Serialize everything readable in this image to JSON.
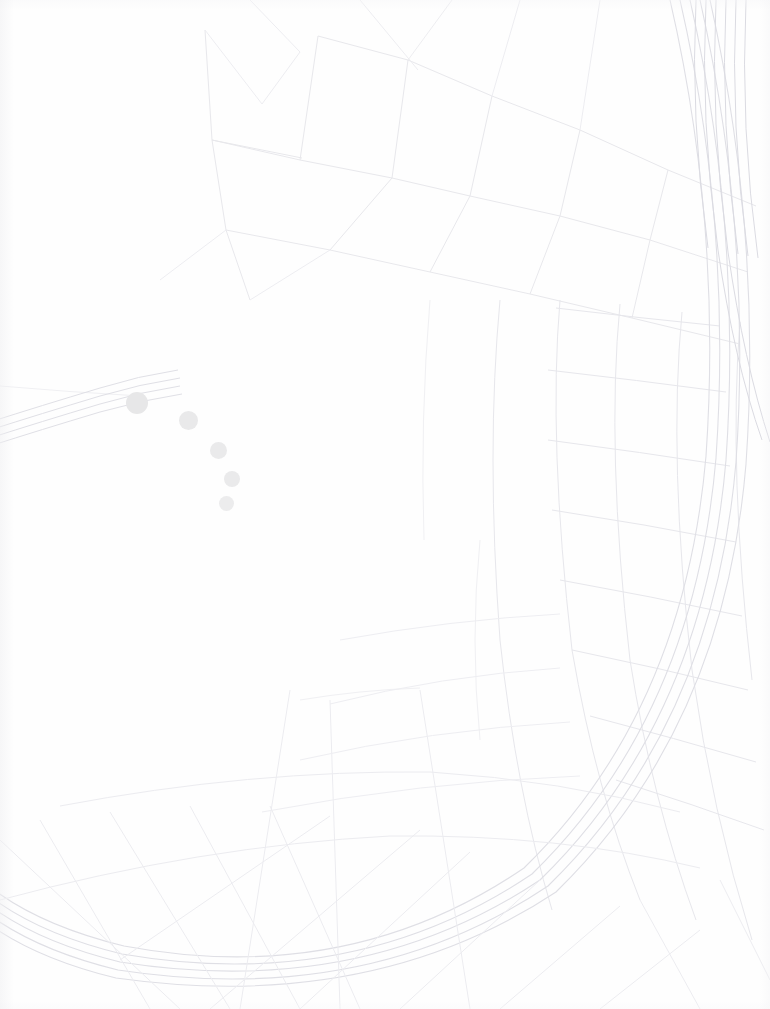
{
  "app": {
    "name": "map-viewer",
    "state": "loading",
    "canvas_width": 770,
    "canvas_height": 1009,
    "background_color": "#fefefe"
  },
  "loading": {
    "status_text": "",
    "spinner_name": "arc-dot-spinner",
    "dot_count": 5,
    "dot_color": "#e9e9ea",
    "dots": [
      {
        "label": "dot-1",
        "cx": 137,
        "cy": 403,
        "r": 11,
        "color": "#e7e7e8"
      },
      {
        "label": "dot-2",
        "cx": 188,
        "cy": 420,
        "r": 9.5,
        "color": "#e9e9ea"
      },
      {
        "label": "dot-3",
        "cx": 218,
        "cy": 450,
        "r": 8.5,
        "color": "#eaeaeb"
      },
      {
        "label": "dot-4",
        "cx": 232,
        "cy": 479,
        "r": 8,
        "color": "#eaeaeb"
      },
      {
        "label": "dot-5",
        "cx": 226,
        "cy": 503,
        "r": 7.5,
        "color": "#ececed"
      }
    ]
  },
  "map": {
    "render_opacity": "very-low",
    "line_color": "#e4e4e8",
    "highway_color": "#dcdce2",
    "features": [
      {
        "name": "ring-road",
        "type": "arc",
        "description": "large circular motorway sweeping through lower half"
      },
      {
        "name": "radial-freeway",
        "type": "bundle",
        "description": "bundle of parallel carriageways at upper right"
      },
      {
        "name": "street-grid-north",
        "type": "grid",
        "description": "block outlines upper centre"
      },
      {
        "name": "street-grid-east",
        "type": "grid",
        "description": "curved block grid right side"
      },
      {
        "name": "highway-west",
        "type": "band",
        "description": "road band entering left edge near y=400"
      },
      {
        "name": "radial-spokes-south",
        "type": "lines",
        "description": "radial connector roads below ring"
      }
    ]
  },
  "overlays": {
    "has_toolbar": false,
    "has_search": false,
    "has_attribution": false,
    "has_zoom_controls": false,
    "has_scale_bar": false
  }
}
